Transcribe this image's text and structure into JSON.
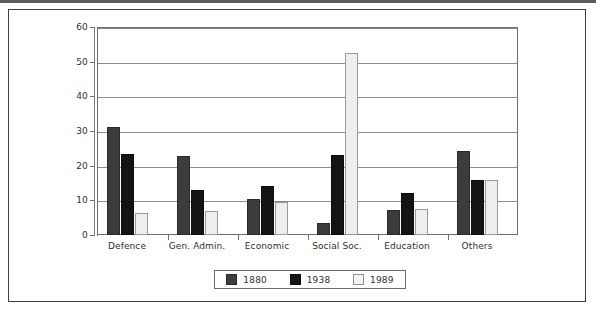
{
  "chart_data": {
    "type": "bar",
    "title": "",
    "subtitle": "",
    "xlabel": "",
    "ylabel": "",
    "ylim": [
      0,
      60
    ],
    "yticks": [
      0,
      10,
      20,
      30,
      40,
      50,
      60
    ],
    "grid": true,
    "legend_position": "bottom-center",
    "categories": [
      "Defence",
      "Gen. Admin.",
      "Economic",
      "Social Soc.",
      "Education",
      "Others"
    ],
    "series": [
      {
        "name": "1880",
        "color": "#3c3c3c",
        "values": [
          31.3,
          22.8,
          10.3,
          3.5,
          7.3,
          24.3
        ]
      },
      {
        "name": "1938",
        "color": "#141414",
        "values": [
          23.5,
          13.0,
          14.0,
          23.0,
          12.0,
          15.8
        ]
      },
      {
        "name": "1989",
        "color": "#eeeeee",
        "values": [
          6.3,
          7.0,
          9.5,
          52.5,
          7.5,
          15.8
        ]
      }
    ]
  },
  "figure": {
    "frame_color": "#3f3f3f",
    "axis_color": "#6e6e6e",
    "grid_color": "#8c8c8c",
    "background": "#ffffff"
  }
}
